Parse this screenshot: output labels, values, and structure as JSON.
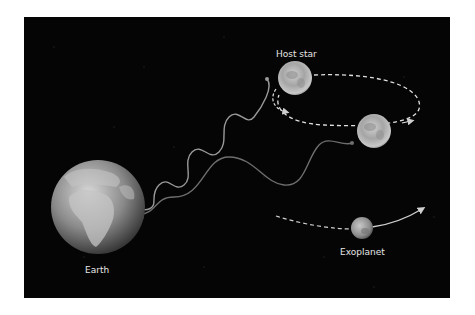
{
  "diagram": {
    "colors": {
      "background": "#050505",
      "wave_light": "#9a9a9a",
      "wave_dark": "#6e6e6e",
      "orbit_dash": "#e0e0e0",
      "label": "#e6e6e6"
    },
    "labels": {
      "host_star": "Host star",
      "earth": "Earth",
      "exoplanet": "Exoplanet"
    },
    "elements": [
      {
        "name": "Earth",
        "shape": "globe"
      },
      {
        "name": "Host star (position 1)",
        "shape": "sphere"
      },
      {
        "name": "Host star (position 2)",
        "shape": "sphere"
      },
      {
        "name": "Exoplanet",
        "shape": "sphere"
      },
      {
        "name": "Short-wavelength light wave",
        "from": "Host star (position 1)",
        "to": "Earth"
      },
      {
        "name": "Long-wavelength light wave",
        "from": "Host star (position 2)",
        "to": "Earth"
      },
      {
        "name": "Star wobble orbit",
        "style": "dashed ellipse"
      },
      {
        "name": "Exoplanet orbit path",
        "style": "dashed then solid arrow"
      }
    ]
  }
}
